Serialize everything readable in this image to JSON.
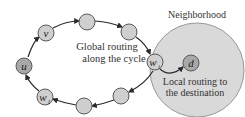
{
  "diagram": {
    "type": "cycle-routing",
    "neighborhood": {
      "label": "Neighborhood",
      "cx": 197,
      "cy": 70,
      "r": 47,
      "fill": "#d9d9d9",
      "stroke": "#9a9a9a"
    },
    "colors": {
      "node_fill": "#cfcfcf",
      "node_fill_dark": "#a8a8a8",
      "node_stroke": "#5a5a5a",
      "edge": "#2a2a2a"
    },
    "nodes": [
      {
        "id": "u",
        "label": "u",
        "sub": "",
        "cx": 24,
        "cy": 66,
        "dark": true
      },
      {
        "id": "v",
        "label": "v",
        "sub": "",
        "cx": 46,
        "cy": 33,
        "dark": false
      },
      {
        "id": "n2",
        "label": "",
        "sub": "",
        "cx": 87,
        "cy": 23,
        "dark": false
      },
      {
        "id": "n3",
        "label": "",
        "sub": "",
        "cx": 129,
        "cy": 32,
        "dark": false
      },
      {
        "id": "wi",
        "label": "w",
        "sub": "i",
        "cx": 155,
        "cy": 62,
        "dark": false
      },
      {
        "id": "n5",
        "label": "",
        "sub": "",
        "cx": 121,
        "cy": 96,
        "dark": false
      },
      {
        "id": "n6",
        "label": "",
        "sub": "",
        "cx": 84,
        "cy": 105,
        "dark": false
      },
      {
        "id": "w1",
        "label": "w",
        "sub": "1",
        "cx": 45,
        "cy": 97,
        "dark": false
      },
      {
        "id": "d",
        "label": "d",
        "sub": "",
        "cx": 191,
        "cy": 63,
        "dark": true
      }
    ],
    "annotations": {
      "global_line1": "Global routing",
      "global_line2": "along the cycle",
      "local_line1": "Local routing to",
      "local_line2": "the destination"
    }
  }
}
